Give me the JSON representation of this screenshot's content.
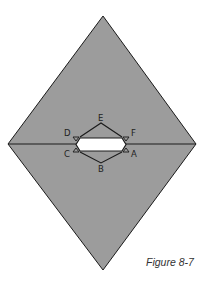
{
  "figure": {
    "caption": "Figure 8-7",
    "colors": {
      "fill": "#9c9c9c",
      "stroke": "#1a1a1a",
      "hole": "#ffffff"
    },
    "shape": "diamond",
    "diamond_vertices": {
      "top": [
        103,
        16
      ],
      "right": [
        196,
        144
      ],
      "bottom": [
        103,
        270
      ],
      "left": [
        8,
        144
      ]
    },
    "labels": [
      {
        "id": "E",
        "text": "E"
      },
      {
        "id": "D",
        "text": "D"
      },
      {
        "id": "F",
        "text": "F"
      },
      {
        "id": "C",
        "text": "C"
      },
      {
        "id": "A",
        "text": "A"
      },
      {
        "id": "B",
        "text": "B"
      }
    ]
  }
}
